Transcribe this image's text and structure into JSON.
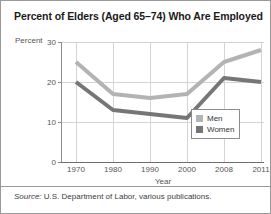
{
  "chart_data": {
    "type": "line",
    "title": "Percent of Elders (Aged 65–74) Who Are Employed",
    "xlabel": "Year",
    "ylabel": "Percent",
    "categories": [
      "1970",
      "1980",
      "1990",
      "2000",
      "2008",
      "2011"
    ],
    "ylim": [
      0,
      30
    ],
    "yticks": [
      "0",
      "10",
      "20",
      "30"
    ],
    "grid": true,
    "legend_position": "inside-bottom-right",
    "series": [
      {
        "name": "Men",
        "values": [
          25,
          17,
          16,
          17,
          25,
          28
        ],
        "color": "#b3b3b3"
      },
      {
        "name": "Women",
        "values": [
          20,
          13,
          12,
          11,
          21,
          20
        ],
        "color": "#767676"
      }
    ],
    "source": "U.S. Department of Labor, various publications.",
    "source_label": "Source:"
  },
  "legend": {
    "items": [
      {
        "label": "Men",
        "color": "#b3b3b3"
      },
      {
        "label": "Women",
        "color": "#767676"
      }
    ]
  }
}
